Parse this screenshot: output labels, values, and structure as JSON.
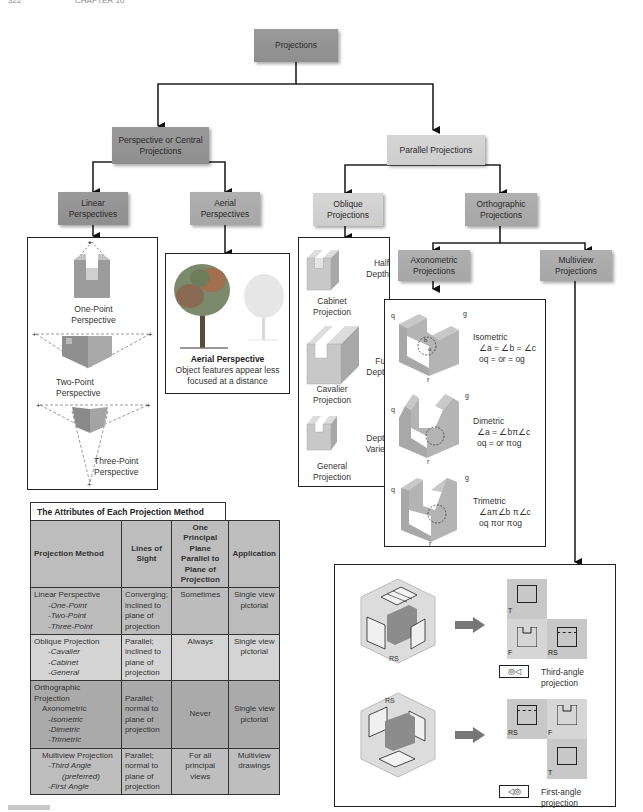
{
  "page_header": {
    "page_number": "322",
    "chapter": "CHAPTER 10"
  },
  "colors": {
    "dark_node": "#909090",
    "mid_node": "#a8a8a8",
    "light_node": "#d0d0d0",
    "line": "#222222"
  },
  "tree": {
    "root": "Projections",
    "perspective": "Perspective or Central Projections",
    "parallel": "Parallel Projections",
    "linear": "Linear Perspectives",
    "aerial": "Aerial Perspectives",
    "oblique": "Oblique Projections",
    "orthographic": "Orthographic Projections",
    "axonometric": "Axonometric Projections",
    "multiview": "Multiview Projections"
  },
  "linear_panel": {
    "one_point": "One-Point Perspective",
    "two_point": "Two-Point Perspective",
    "three_point": "Three-Point Perspective"
  },
  "aerial_panel": {
    "title": "Aerial Perspective",
    "caption": "Object features appear less focused at a distance"
  },
  "oblique_panel": {
    "items": [
      {
        "depth": "Half Depth",
        "name": "Cabinet Projection"
      },
      {
        "depth": "Full Depth",
        "name": "Cavalier Projection"
      },
      {
        "depth": "Depth Varies",
        "name": "General Projection"
      }
    ]
  },
  "axonometric_panel": {
    "items": [
      {
        "name": "Isometric",
        "angles": "∠a = ∠b = ∠c",
        "lengths": "oq = or = og"
      },
      {
        "name": "Dimetric",
        "angles": "∠a = ∠bπ∠c",
        "lengths": "oq = or πog"
      },
      {
        "name": "Trimetric",
        "angles": "∠aπ∠b π∠c",
        "lengths": "oq πor πog"
      }
    ],
    "axis_labels": {
      "q": "q",
      "g": "g",
      "r": "r",
      "a": "a",
      "b": "b",
      "o": "o",
      "c": "c"
    }
  },
  "multiview_panel": {
    "third_angle": {
      "caption": "Third-angle projection",
      "views": [
        "T",
        "F",
        "RS"
      ]
    },
    "first_angle": {
      "caption": "First-angle projection",
      "views": [
        "RS",
        "F",
        "T"
      ]
    },
    "box_labels": {
      "rs": "RS",
      "f": "F",
      "t": "T"
    }
  },
  "table": {
    "title": "The Attributes of Each Projection Method",
    "headers": [
      "Projection Method",
      "Lines of Sight",
      "One Principal Plane Parallel to Plane of Projection",
      "Application"
    ],
    "rows": [
      {
        "method": "Linear Perspective",
        "subs": [
          "-One-Point",
          "-Two-Point",
          "-Three-Point"
        ],
        "sight": "Converging; inclined to plane of projection",
        "plane": "Sometimes",
        "application": "Single view pictorial"
      },
      {
        "method": "Oblique Projection",
        "subs": [
          "-Cavalier",
          "-Cabinet",
          "-General"
        ],
        "sight": "Parallel; inclined to plane of projection",
        "plane": "Always",
        "application": "Single view pictorial"
      },
      {
        "method": "Orthographic Projection",
        "sub_heading": "Axonometric",
        "subs": [
          "-Isometric",
          "-Dimetric",
          "-Trimetric"
        ],
        "sight": "Parallel; normal to plane of projection",
        "plane": "Never",
        "application": "Single view pictorial"
      },
      {
        "method": "Multiview Projection",
        "subs": [
          "-Third Angle",
          "(preferred)",
          "-First Angle"
        ],
        "sight": "Parallel; normal to plane of projection",
        "plane": "For all principal views",
        "application": "Multiview drawings"
      }
    ]
  }
}
